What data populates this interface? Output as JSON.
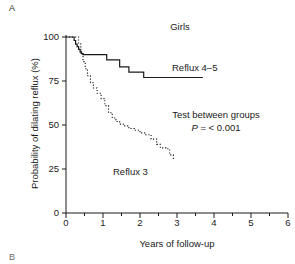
{
  "figure": {
    "panel_label": "A",
    "next_panel_label": "B"
  },
  "chart_data": {
    "type": "line",
    "title": "Girls",
    "xlabel": "Years of follow-up",
    "ylabel": "Probability of dilating reflux (%)",
    "xlim": [
      0,
      6
    ],
    "ylim": [
      0,
      100
    ],
    "xticks": [
      0,
      1,
      2,
      3,
      4,
      5,
      6
    ],
    "xtick_labels": [
      "0",
      "1",
      "2",
      "3",
      "4",
      "5",
      "6"
    ],
    "xminor_ticks": [
      0.5,
      1.5,
      2.5,
      3.5,
      4.5,
      5.5
    ],
    "yticks": [
      0,
      25,
      50,
      75,
      100
    ],
    "ytick_labels": [
      "0",
      "25",
      "50",
      "75",
      "100"
    ],
    "grid": false,
    "legend_position": "inline-annotation",
    "series": [
      {
        "name": "Reflux 4-5",
        "label": "Reflux 4–5",
        "style": "solid",
        "step": true,
        "color": "#1a1a1a",
        "x": [
          0.0,
          0.18,
          0.22,
          0.26,
          0.3,
          0.34,
          0.38,
          0.42,
          0.46,
          1.1,
          1.45,
          1.7,
          2.1,
          3.7
        ],
        "y": [
          100.0,
          100.0,
          98.0,
          96.0,
          94.5,
          93.0,
          91.5,
          90.5,
          90.0,
          87.0,
          83.0,
          80.0,
          77.0,
          77.0
        ]
      },
      {
        "name": "Reflux 3",
        "label": "Reflux 3",
        "style": "dotted",
        "step": true,
        "color": "#1a1a1a",
        "x": [
          0.0,
          0.28,
          0.34,
          0.4,
          0.46,
          0.52,
          0.58,
          0.66,
          0.74,
          0.84,
          0.95,
          1.05,
          1.15,
          1.25,
          1.35,
          1.45,
          1.55,
          1.7,
          1.85,
          2.0,
          2.15,
          2.3,
          2.45,
          2.55,
          2.7,
          2.8,
          2.9
        ],
        "y": [
          100.0,
          100.0,
          96.0,
          91.0,
          86.0,
          82.0,
          78.0,
          74.0,
          71.0,
          68.0,
          65.0,
          61.0,
          57.0,
          54.0,
          52.0,
          50.5,
          49.5,
          48.0,
          47.0,
          45.5,
          44.5,
          42.0,
          39.0,
          37.0,
          36.5,
          33.0,
          30.0
        ]
      }
    ],
    "annotations": [
      {
        "name": "test-between-groups",
        "text": "Test between groups"
      },
      {
        "name": "p-value",
        "prefix": "P",
        "text": " = < 0.001",
        "full": "P = < 0.001"
      }
    ]
  }
}
